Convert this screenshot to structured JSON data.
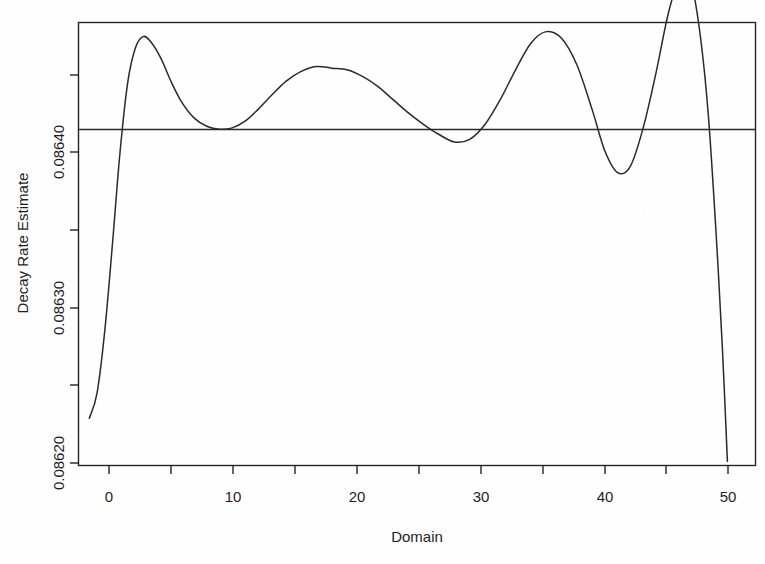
{
  "chart_data": {
    "type": "line",
    "title": "",
    "subtitle": "",
    "xlabel": "Domain",
    "ylabel": "Decay Rate Estimate",
    "xlim": [
      -0.85,
      52.2
    ],
    "ylim": [
      0.0861985,
      0.0864655
    ],
    "grid": false,
    "legend": null,
    "x_ticks": [
      0,
      10,
      20,
      30,
      40,
      50
    ],
    "x_tick_labels": [
      "0",
      "10",
      "20",
      "30",
      "40",
      "50"
    ],
    "x_minor_ticks": [
      5,
      15,
      25,
      35,
      45
    ],
    "y_ticks": [
      0.0862,
      0.0863,
      0.0864
    ],
    "y_tick_labels": [
      "0.08620",
      "0.08630",
      "0.08640"
    ],
    "y_minor_ticks": [
      0.08625,
      0.08635,
      0.08645
    ],
    "series": [
      {
        "name": "decay rate estimate",
        "type": "line",
        "x": [
          0,
          0.6,
          1.2,
          1.8,
          2.4,
          3.0,
          3.6,
          4.2,
          4.8,
          5.6,
          6.4,
          7.2,
          8.2,
          9.2,
          10.2,
          11.2,
          12.2,
          13.2,
          14.2,
          15.4,
          16.6,
          17.8,
          19.0,
          20.2,
          21.4,
          22.6,
          23.8,
          25.0,
          26.2,
          27.4,
          28.6,
          29.8,
          31.0,
          32.2,
          33.4,
          34.6,
          35.8,
          37.0,
          38.2,
          39.4,
          40.4,
          41.4,
          42.4,
          43.4,
          44.4,
          45.4,
          46.4,
          47.2,
          47.9,
          48.5,
          49.1,
          49.6,
          50.0
        ],
        "y": [
          0.086227,
          0.086242,
          0.086279,
          0.086331,
          0.086387,
          0.086429,
          0.08645,
          0.086457,
          0.086454,
          0.086444,
          0.08643,
          0.086418,
          0.086408,
          0.086403,
          0.0864012,
          0.086402,
          0.086406,
          0.086413,
          0.086421,
          0.08643,
          0.086436,
          0.086439,
          0.086438,
          0.086437,
          0.086433,
          0.086427,
          0.086419,
          0.086411,
          0.086404,
          0.086398,
          0.0863935,
          0.086395,
          0.086404,
          0.086419,
          0.086437,
          0.086453,
          0.08646,
          0.086456,
          0.08644,
          0.086413,
          0.086388,
          0.086375,
          0.086379,
          0.086402,
          0.086435,
          0.086472,
          0.086495,
          0.086488,
          0.086456,
          0.08641,
          0.08634,
          0.08627,
          0.086201
        ]
      },
      {
        "name": "reference level",
        "type": "hline",
        "y_value": 0.086401
      }
    ],
    "annotations": []
  },
  "axes": {
    "x_axis_title": "Domain",
    "y_axis_title": "Decay Rate Estimate"
  },
  "icons": {
    "none": ""
  }
}
